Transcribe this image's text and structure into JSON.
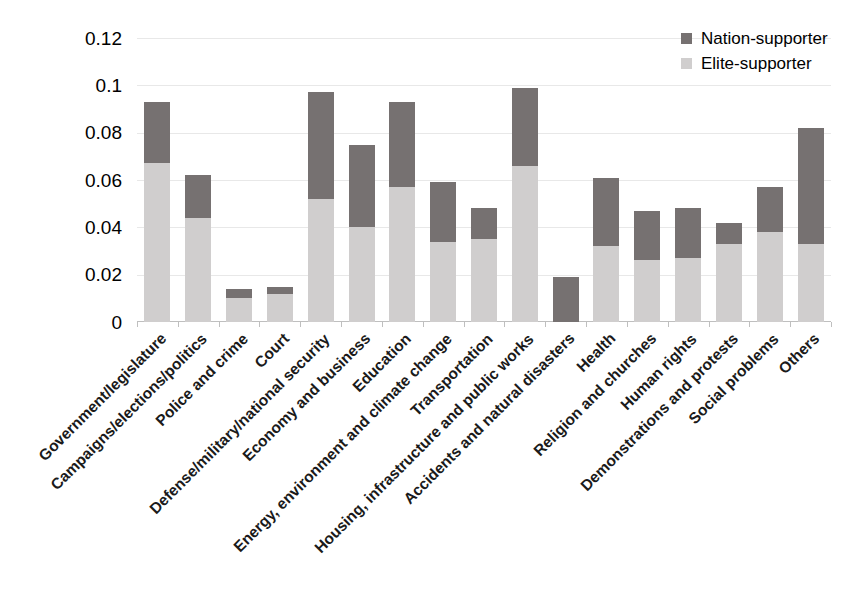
{
  "chart_data": {
    "type": "bar",
    "subtype": "stacked-vertical",
    "title": "",
    "xlabel": "",
    "ylabel": "",
    "ylim": [
      0,
      0.12
    ],
    "ytick_labels": [
      "0.12",
      "0.1",
      "0.08",
      "0.06",
      "0.04",
      "0.02",
      "0"
    ],
    "ytick_values": [
      0.12,
      0.1,
      0.08,
      0.06,
      0.04,
      0.02,
      0
    ],
    "grid": true,
    "legend_position": "top-right",
    "categories": [
      "Government/legislature",
      "Campaigns/elections/politics",
      "Police and crime",
      "Court",
      "Defense/military/national security",
      "Economy and business",
      "Education",
      "Energy, environment and climate change",
      "Transportation",
      "Housing, infrastructure and public works",
      "Accidents and natural disasters",
      "Health",
      "Religion and churches",
      "Human rights",
      "Demonstrations and protests",
      "Social problems",
      "Others"
    ],
    "series": [
      {
        "name": "Elite-supporter",
        "color": "#d0cece",
        "values": [
          0.067,
          0.044,
          0.01,
          0.012,
          0.052,
          0.04,
          0.057,
          0.034,
          0.035,
          0.066,
          0.0,
          0.032,
          0.026,
          0.027,
          0.033,
          0.038,
          0.033
        ]
      },
      {
        "name": "Nation-supporter",
        "color": "#767171",
        "values": [
          0.026,
          0.018,
          0.004,
          0.003,
          0.045,
          0.035,
          0.036,
          0.025,
          0.013,
          0.033,
          0.019,
          0.029,
          0.021,
          0.021,
          0.009,
          0.019,
          0.049
        ]
      }
    ],
    "totals": [
      0.093,
      0.062,
      0.014,
      0.015,
      0.097,
      0.075,
      0.093,
      0.059,
      0.048,
      0.099,
      0.019,
      0.061,
      0.047,
      0.048,
      0.042,
      0.057,
      0.082
    ]
  },
  "legend": {
    "items": [
      {
        "label": "Nation-supporter",
        "color": "#767171"
      },
      {
        "label": "Elite-supporter",
        "color": "#d0cece"
      }
    ]
  },
  "colors": {
    "nation_supporter": "#767171",
    "elite_supporter": "#d0cece",
    "gridline": "#e8e8e8",
    "axis": "#bfbfbf",
    "background": "#ffffff"
  }
}
